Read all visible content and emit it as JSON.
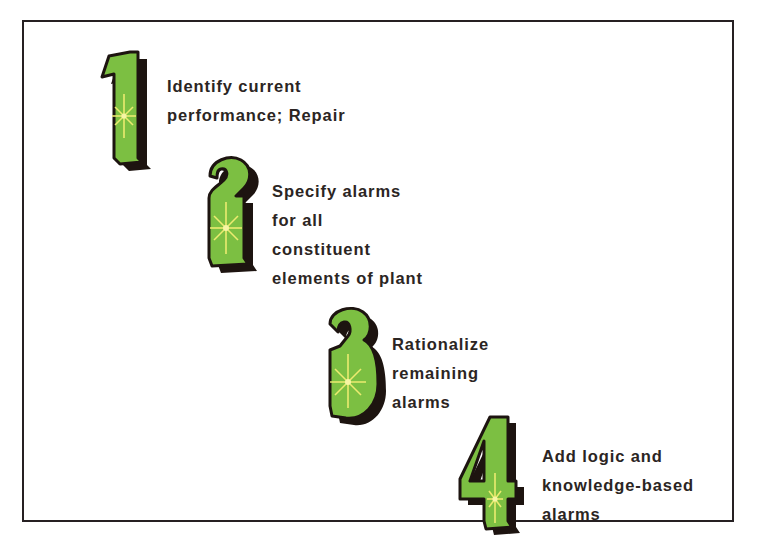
{
  "diagram": {
    "type": "staircase-step-diagram",
    "orientation": "descending-left-to-right",
    "background_color": "#ffffff",
    "frame_color": "#262022",
    "numeral_fill_color": "#7cbf42",
    "numeral_shadow_color": "#1d1410",
    "numeral_outline_color": "#1d1410",
    "sparkle_color": "#f2ee72",
    "text_color": "#2b2523",
    "steps": [
      {
        "number": "1",
        "numeral_name": "numeral-one",
        "lines": [
          "Identify current",
          "performance; Repair"
        ]
      },
      {
        "number": "2",
        "numeral_name": "numeral-two",
        "lines": [
          "Specify alarms",
          "for all",
          "constituent",
          "elements of plant"
        ]
      },
      {
        "number": "3",
        "numeral_name": "numeral-three",
        "lines": [
          "Rationalize",
          "remaining",
          "alarms"
        ]
      },
      {
        "number": "4",
        "numeral_name": "numeral-four",
        "lines": [
          "Add logic and",
          "knowledge-based",
          "alarms"
        ]
      }
    ]
  }
}
